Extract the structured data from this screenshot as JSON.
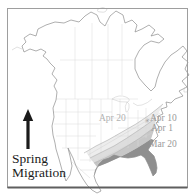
{
  "caption": {
    "line1": "Spring",
    "line2": "Migration"
  },
  "arrow": {
    "direction": "up"
  },
  "map": {
    "isochrone_labels": [
      {
        "id": "apr20",
        "text": "Apr 20"
      },
      {
        "id": "apr10",
        "text": "Apr 10"
      },
      {
        "id": "apr1",
        "text": "Apr 1"
      },
      {
        "id": "mar20",
        "text": "Mar 20"
      }
    ],
    "marker_glyph": "✳"
  },
  "colors": {
    "background": "#ffffff",
    "frame": "#9e9e9e",
    "frame_bottom": "#5f5f5f",
    "coastline": "#8c8c8c",
    "interior_line": "#d9d9d9",
    "lakes_line": "#c6c6c6",
    "island_line": "#c0c0c0",
    "band_apr20": "#ededed",
    "band_apr10": "#dddddd",
    "band_apr1": "#c7c7c7",
    "band_mar20": "#8f8f8f",
    "isochrone_line": "#ababab",
    "isochrone_faint": "#d2d2d2",
    "label_gray": "#9a9a9a",
    "label_light": "#b2b2b2",
    "text": "#1b1b1b"
  }
}
